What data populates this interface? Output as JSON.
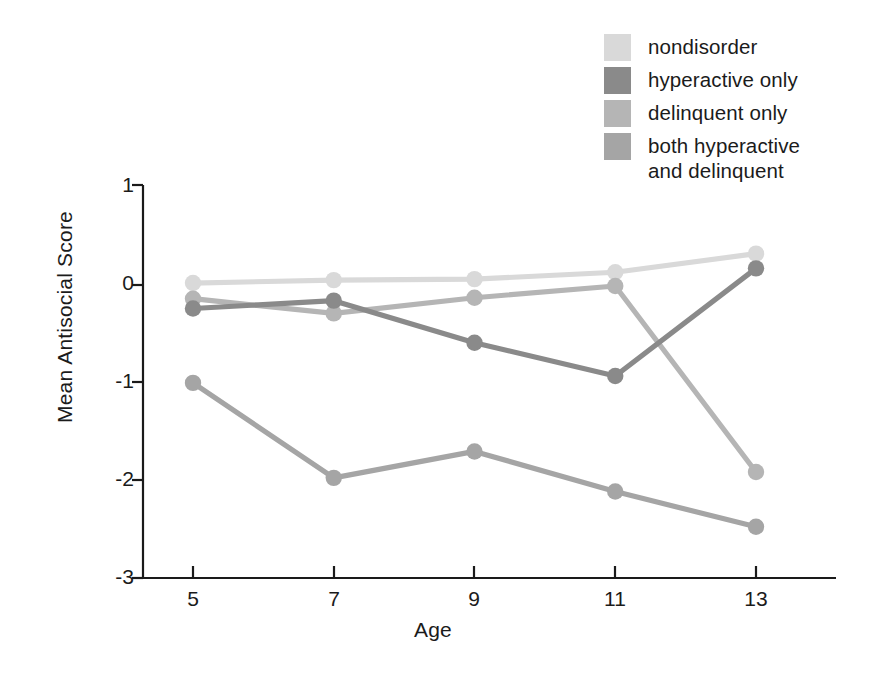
{
  "chart_data": {
    "type": "line",
    "title": "",
    "subtitle": "",
    "xlabel": "Age",
    "ylabel": "Mean Antisocial Score",
    "x": [
      5,
      7,
      9,
      11,
      13
    ],
    "categories": [
      "5",
      "7",
      "9",
      "11",
      "13"
    ],
    "xtick_labels": [
      "5",
      "7",
      "9",
      "11",
      "13"
    ],
    "ytick_labels": [
      "1",
      "0",
      "-1",
      "-2",
      "-3"
    ],
    "ytick_values": [
      1,
      0,
      -1,
      -2,
      -3
    ],
    "xlim": [
      4.3,
      13.9
    ],
    "ylim": [
      -3,
      1
    ],
    "grid": false,
    "legend_position": "top-right",
    "series": [
      {
        "name": "nondisorder",
        "color": "#d9d9d9",
        "values": [
          0.02,
          0.05,
          0.06,
          0.13,
          0.32
        ]
      },
      {
        "name": "hyperactive only",
        "color": "#8a8a8a",
        "values": [
          -0.24,
          -0.16,
          -0.59,
          -0.93,
          0.17
        ]
      },
      {
        "name": "delinquent only",
        "color": "#b5b5b5",
        "values": [
          -0.14,
          -0.29,
          -0.13,
          -0.01,
          -1.91
        ]
      },
      {
        "name": "both hyperactive and delinquent",
        "color": "#a5a5a5",
        "values": [
          -1.0,
          -1.97,
          -1.7,
          -2.11,
          -2.47
        ]
      }
    ]
  },
  "legend": {
    "items": [
      {
        "label": "nondisorder",
        "color": "#d9d9d9"
      },
      {
        "label": "hyperactive only",
        "color": "#8a8a8a"
      },
      {
        "label": "delinquent only",
        "color": "#b5b5b5"
      },
      {
        "label": "both hyperactive\nand delinquent",
        "color": "#a5a5a5"
      }
    ]
  },
  "axes": {
    "y_title": "Mean Antisocial Score",
    "x_title": "Age",
    "y_ticks": [
      "1",
      "0",
      "-1",
      "-2",
      "-3"
    ],
    "x_ticks": [
      "5",
      "7",
      "9",
      "11",
      "13"
    ],
    "axis_color": "#1a1a1a"
  }
}
